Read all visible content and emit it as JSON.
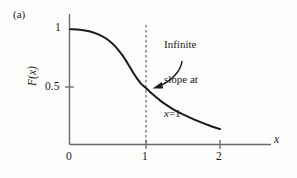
{
  "figure": {
    "panel_label": "(a)",
    "background_color": "#fdfdfc",
    "ink_color": "#1a1a1a"
  },
  "annotation": {
    "line1": "Infinite",
    "line2": "slope at",
    "line3_var": "x",
    "line3_rest": "=1",
    "arrow": "curved-arrow-to-curve"
  },
  "axes": {
    "x_title": "x",
    "y_title": "F(x)",
    "x_ticks": [
      "0",
      "1",
      "2"
    ],
    "y_ticks": [
      "0.5",
      "1"
    ]
  },
  "chart_data": {
    "type": "line",
    "title": "(a)",
    "xlabel": "x",
    "ylabel": "F(x)",
    "xlim": [
      0,
      2
    ],
    "ylim": [
      0,
      1
    ],
    "xticks": [
      0,
      1,
      2
    ],
    "xticklabels": [
      "0",
      "1",
      "2"
    ],
    "yticks": [
      0.5,
      1
    ],
    "yticklabels": [
      "0.5",
      "1"
    ],
    "grid": false,
    "legend": null,
    "series": [
      {
        "name": "F(x)",
        "color": "#1a1a1a",
        "linewidth": 2,
        "x": [
          0.0,
          0.1,
          0.2,
          0.3,
          0.4,
          0.5,
          0.6,
          0.7,
          0.75,
          0.8,
          0.85,
          0.9,
          0.95,
          1.0,
          1.05,
          1.1,
          1.15,
          1.2,
          1.25,
          1.3,
          1.4,
          1.5,
          1.6,
          1.7,
          1.8,
          1.9,
          2.0
        ],
        "y": [
          1.0,
          0.998,
          0.99,
          0.975,
          0.95,
          0.912,
          0.855,
          0.775,
          0.725,
          0.672,
          0.618,
          0.57,
          0.528,
          0.5,
          0.47,
          0.44,
          0.412,
          0.386,
          0.362,
          0.34,
          0.3,
          0.266,
          0.236,
          0.208,
          0.182,
          0.158,
          0.138
        ]
      }
    ],
    "annotations": [
      {
        "text": "Infinite slope at x=1",
        "target_x": 1.0,
        "target_y": 0.5,
        "style": "curved-arrow"
      },
      {
        "type": "vline",
        "x": 1.0,
        "linestyle": "dashed",
        "color": "#444444"
      }
    ]
  }
}
